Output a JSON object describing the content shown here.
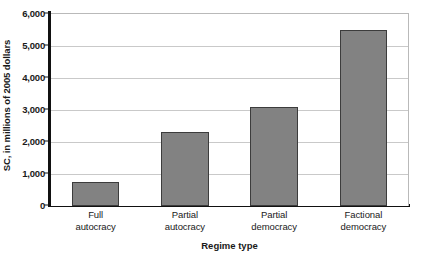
{
  "chart_data": {
    "type": "bar",
    "title": "",
    "categories": [
      "Full autocracy",
      "Partial autocracy",
      "Partial democracy",
      "Factional democracy"
    ],
    "category_lines": [
      [
        "Full",
        "autocracy"
      ],
      [
        "Partial",
        "autocracy"
      ],
      [
        "Partial",
        "democracy"
      ],
      [
        "Factional",
        "democracy"
      ]
    ],
    "values": [
      750,
      2300,
      3100,
      5500
    ],
    "xlabel": "Regime type",
    "ylabel": "SC, in millions of 2005 dollars",
    "ylim": [
      0,
      6000
    ],
    "ytick_values": [
      0,
      1000,
      2000,
      3000,
      4000,
      5000,
      6000
    ],
    "ytick_labels": [
      "0",
      "1,000",
      "2,000",
      "3,000",
      "4,000",
      "5,000",
      "6,000"
    ],
    "grid": "horizontal",
    "legend": "none",
    "colors": {
      "bar_fill": "#828282",
      "bar_edge": "#3c3c3c",
      "gridline": "#c9c9c9",
      "axis": "#111111",
      "plot_background": "#ffffff",
      "text": "#1a1a1a"
    }
  }
}
